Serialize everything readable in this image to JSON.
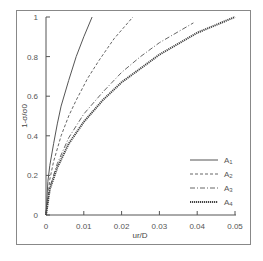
{
  "chart_data": {
    "type": "line",
    "title": "",
    "xlabel": "ur/D",
    "ylabel": "1-σ/σ0",
    "xlim": [
      0,
      0.05
    ],
    "ylim": [
      0,
      1
    ],
    "xticks": [
      "0",
      "0.01",
      "0.02",
      "0.03",
      "0.04",
      "0.05"
    ],
    "yticks": [
      "0",
      "0.2",
      "0.4",
      "0.6",
      "0.8",
      "1"
    ],
    "grid": false,
    "legend_position": "lower right",
    "series": [
      {
        "name": "A1",
        "style": "solid",
        "x": [
          0,
          0.0005,
          0.001,
          0.002,
          0.003,
          0.004,
          0.006,
          0.008,
          0.01,
          0.0122
        ],
        "y": [
          0,
          0.17,
          0.25,
          0.36,
          0.46,
          0.55,
          0.68,
          0.8,
          0.9,
          1.0
        ]
      },
      {
        "name": "A2",
        "style": "dashed",
        "x": [
          0,
          0.001,
          0.002,
          0.004,
          0.006,
          0.008,
          0.011,
          0.014,
          0.018,
          0.023
        ],
        "y": [
          0,
          0.18,
          0.27,
          0.4,
          0.5,
          0.58,
          0.69,
          0.78,
          0.89,
          1.0
        ]
      },
      {
        "name": "A3",
        "style": "dash-dot",
        "x": [
          0,
          0.001,
          0.003,
          0.006,
          0.01,
          0.015,
          0.02,
          0.025,
          0.03,
          0.039
        ],
        "y": [
          0,
          0.14,
          0.26,
          0.39,
          0.51,
          0.62,
          0.72,
          0.8,
          0.87,
          0.97
        ]
      },
      {
        "name": "A4",
        "style": "dotted-bold",
        "x": [
          0,
          0.001,
          0.003,
          0.006,
          0.01,
          0.015,
          0.02,
          0.025,
          0.03,
          0.04,
          0.05
        ],
        "y": [
          0,
          0.13,
          0.24,
          0.36,
          0.47,
          0.58,
          0.67,
          0.74,
          0.81,
          0.92,
          1.0
        ]
      }
    ]
  },
  "legend": {
    "items": [
      {
        "label": "A1",
        "sub": "1"
      },
      {
        "label": "A2",
        "sub": "2"
      },
      {
        "label": "A3",
        "sub": "3"
      },
      {
        "label": "A4",
        "sub": "4"
      }
    ]
  }
}
